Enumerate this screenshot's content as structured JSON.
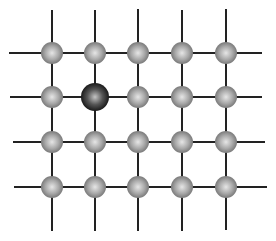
{
  "diagram": {
    "type": "crystal-lattice-with-substitutional-impurity",
    "grid": {
      "rows": 4,
      "cols": 5
    },
    "column_x": [
      52,
      95,
      138,
      182,
      226
    ],
    "row_y": [
      53,
      97,
      142,
      187
    ],
    "bond_lines": {
      "horizontal": [
        {
          "row": 0,
          "x1": 9,
          "x2": 262
        },
        {
          "row": 1,
          "x1": 10,
          "x2": 262
        },
        {
          "row": 2,
          "x1": 13,
          "x2": 265
        },
        {
          "row": 3,
          "x1": 14,
          "x2": 267
        }
      ],
      "vertical": [
        {
          "col": 0,
          "y1": 10,
          "y2": 231
        },
        {
          "col": 1,
          "y1": 10,
          "y2": 231
        },
        {
          "col": 2,
          "y1": 9,
          "y2": 231
        },
        {
          "col": 3,
          "y1": 10,
          "y2": 231
        },
        {
          "col": 4,
          "y1": 9,
          "y2": 230
        }
      ],
      "color": "#222222",
      "width": 2
    },
    "atoms": {
      "host": {
        "radius": 11,
        "highlight": "#e6e6e6",
        "mid": "#a9a9a9",
        "edge": "#6e6e6e"
      },
      "impurity": {
        "row": 1,
        "col": 1,
        "radius": 14,
        "highlight": "#c4c4c4",
        "mid": "#555555",
        "edge": "#0d0d0d"
      }
    }
  }
}
